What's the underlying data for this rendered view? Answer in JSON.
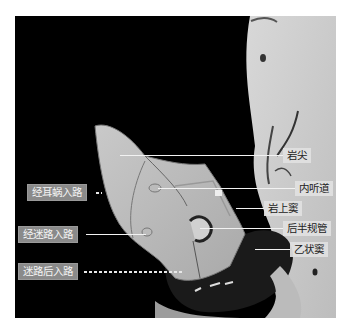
{
  "figure": {
    "background_color": "#000000",
    "structure_labels": [
      {
        "id": "petrous-apex",
        "text": "岩尖"
      },
      {
        "id": "internal-auditory-canal",
        "text": "内听道"
      },
      {
        "id": "superior-petrosal-sinus",
        "text": "岩上窦"
      },
      {
        "id": "posterior-semicircular-canal",
        "text": "后半规管"
      },
      {
        "id": "sigmoid-sinus",
        "text": "乙状窦"
      }
    ],
    "approach_labels": [
      {
        "id": "transcochlear-approach",
        "text": "经耳蜗入路"
      },
      {
        "id": "translabyrinthine-approach",
        "text": "经迷路入路"
      },
      {
        "id": "retrolabyrinthine-approach",
        "text": "迷路后入路"
      }
    ]
  }
}
